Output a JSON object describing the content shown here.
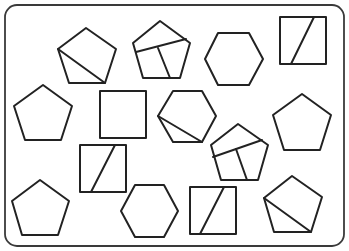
{
  "diagram": {
    "title": "",
    "canvas": {
      "width": 349,
      "height": 251,
      "background": "#ffffff"
    },
    "frame": {
      "x": 5,
      "y": 5,
      "width": 339,
      "height": 241,
      "radius": 12,
      "stroke": "#3a3a3a"
    },
    "stroke_color": "#222222",
    "shapes": [
      {
        "id": "pentagon-1",
        "type": "pentagon",
        "points": [
          [
            86,
            28
          ],
          [
            116,
            49
          ],
          [
            105,
            83
          ],
          [
            69,
            83
          ],
          [
            58,
            49
          ]
        ],
        "cuts": [
          [
            [
              58,
              49
            ],
            [
              105,
              83
            ]
          ]
        ]
      },
      {
        "id": "pentagon-2",
        "type": "pentagon",
        "points": [
          [
            160,
            21
          ],
          [
            190,
            43
          ],
          [
            180,
            78
          ],
          [
            143,
            78
          ],
          [
            133,
            43
          ]
        ],
        "cuts": [
          [
            [
              136,
              52
            ],
            [
              186,
              39
            ]
          ],
          [
            [
              158,
              48
            ],
            [
              170,
              78
            ]
          ]
        ]
      },
      {
        "id": "hexagon-1",
        "type": "hexagon",
        "points": [
          [
            218,
            33
          ],
          [
            249,
            33
          ],
          [
            263,
            59
          ],
          [
            249,
            85
          ],
          [
            218,
            85
          ],
          [
            205,
            59
          ]
        ],
        "cuts": []
      },
      {
        "id": "square-1",
        "type": "square",
        "points": [
          [
            280,
            17
          ],
          [
            326,
            17
          ],
          [
            326,
            64
          ],
          [
            280,
            64
          ]
        ],
        "cuts": [
          [
            [
              314,
              17
            ],
            [
              291,
              64
            ]
          ]
        ]
      },
      {
        "id": "pentagon-3",
        "type": "pentagon",
        "points": [
          [
            43,
            85
          ],
          [
            72,
            106
          ],
          [
            61,
            140
          ],
          [
            25,
            140
          ],
          [
            14,
            106
          ]
        ],
        "cuts": []
      },
      {
        "id": "square-2",
        "type": "square",
        "points": [
          [
            100,
            91
          ],
          [
            146,
            91
          ],
          [
            146,
            138
          ],
          [
            100,
            138
          ]
        ],
        "cuts": []
      },
      {
        "id": "hexagon-2",
        "type": "hexagon",
        "points": [
          [
            173,
            91
          ],
          [
            202,
            91
          ],
          [
            216,
            116
          ],
          [
            202,
            142
          ],
          [
            173,
            142
          ],
          [
            158,
            116
          ]
        ],
        "cuts": [
          [
            [
              158,
              116
            ],
            [
              202,
              142
            ]
          ]
        ]
      },
      {
        "id": "pentagon-4",
        "type": "pentagon",
        "points": [
          [
            302,
            94
          ],
          [
            331,
            115
          ],
          [
            320,
            150
          ],
          [
            284,
            150
          ],
          [
            273,
            115
          ]
        ],
        "cuts": []
      },
      {
        "id": "pentagon-5",
        "type": "pentagon",
        "points": [
          [
            238,
            124
          ],
          [
            268,
            145
          ],
          [
            258,
            180
          ],
          [
            221,
            180
          ],
          [
            211,
            145
          ]
        ],
        "cuts": [
          [
            [
              213,
              157
            ],
            [
              262,
              140
            ]
          ],
          [
            [
              236,
              149
            ],
            [
              247,
              180
            ]
          ]
        ]
      },
      {
        "id": "square-3",
        "type": "square",
        "points": [
          [
            80,
            145
          ],
          [
            126,
            145
          ],
          [
            126,
            192
          ],
          [
            80,
            192
          ]
        ],
        "cuts": [
          [
            [
              115,
              145
            ],
            [
              91,
              192
            ]
          ]
        ]
      },
      {
        "id": "pentagon-6",
        "type": "pentagon",
        "points": [
          [
            40,
            180
          ],
          [
            69,
            201
          ],
          [
            58,
            235
          ],
          [
            22,
            235
          ],
          [
            12,
            201
          ]
        ],
        "cuts": []
      },
      {
        "id": "hexagon-3",
        "type": "hexagon",
        "points": [
          [
            135,
            185
          ],
          [
            164,
            185
          ],
          [
            178,
            211
          ],
          [
            164,
            237
          ],
          [
            135,
            237
          ],
          [
            121,
            211
          ]
        ],
        "cuts": []
      },
      {
        "id": "square-4",
        "type": "square",
        "points": [
          [
            190,
            187
          ],
          [
            236,
            187
          ],
          [
            236,
            234
          ],
          [
            190,
            234
          ]
        ],
        "cuts": [
          [
            [
              224,
              187
            ],
            [
              200,
              234
            ]
          ]
        ]
      },
      {
        "id": "pentagon-7",
        "type": "pentagon",
        "points": [
          [
            292,
            176
          ],
          [
            322,
            197
          ],
          [
            311,
            232
          ],
          [
            274,
            232
          ],
          [
            264,
            198
          ]
        ],
        "cuts": [
          [
            [
              264,
              198
            ],
            [
              311,
              232
            ]
          ]
        ]
      }
    ],
    "counts": {
      "pentagon": 7,
      "hexagon": 3,
      "square": 4,
      "total": 14
    }
  }
}
